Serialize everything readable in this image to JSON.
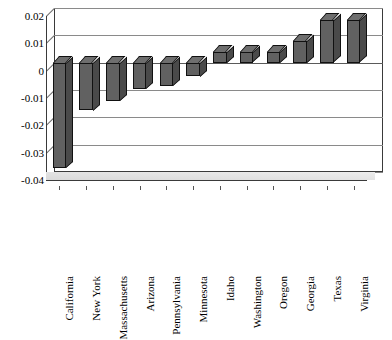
{
  "chart_data": {
    "type": "bar",
    "title": "",
    "xlabel": "",
    "ylabel": "",
    "ylim": [
      -0.04,
      0.02
    ],
    "yticks": [
      0.02,
      0.01,
      0,
      -0.01,
      -0.02,
      -0.03,
      -0.04
    ],
    "ytick_labels": [
      "0.02",
      "0.01",
      "0",
      "-0.01",
      "-0.02",
      "-0.03",
      "-0.04"
    ],
    "grid": true,
    "legend": "none",
    "style": "3d-column",
    "bar_color": "#616161",
    "bar_edge_color": "#111111",
    "gridline_color": "#8a8a8a",
    "categories": [
      "California",
      "New York",
      "Massachusetts",
      "Arizona",
      "Pennsylvania",
      "Minnesota",
      "Idaho",
      "Washington",
      "Oregon",
      "Georgia",
      "Texas",
      "Virginia"
    ],
    "values": [
      -0.0385,
      -0.0175,
      -0.014,
      -0.0095,
      -0.0085,
      -0.005,
      0.004,
      0.0038,
      0.004,
      0.008,
      0.0155,
      0.0155
    ]
  }
}
